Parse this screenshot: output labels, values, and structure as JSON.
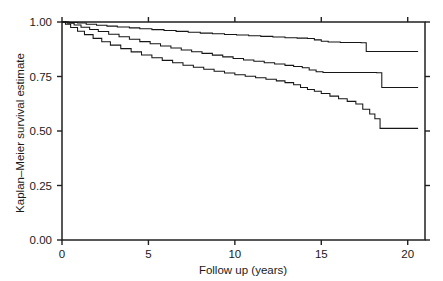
{
  "chart_data": {
    "type": "line",
    "title": "",
    "subtitle": "",
    "xlabel": "Follow up (years)",
    "ylabel": "Kaplan–Meier survival estimate",
    "xlim": [
      0,
      21
    ],
    "ylim": [
      0,
      1
    ],
    "xticks": [
      0,
      5,
      10,
      15,
      20
    ],
    "xticklabels": [
      "0",
      "5",
      "10",
      "15",
      "20"
    ],
    "yticks": [
      0.0,
      0.25,
      0.5,
      0.75,
      1.0
    ],
    "yticklabels": [
      "0.00",
      "0.25",
      "0.50",
      "0.75",
      "1.00"
    ],
    "grid": false,
    "legend": "none",
    "ticks_all_sides": true,
    "step_shape": "post",
    "series": [
      {
        "name": "curve-upper",
        "color": "#161616",
        "x": [
          0.0,
          0.4,
          0.9,
          1.4,
          2.0,
          2.6,
          3.2,
          3.9,
          4.5,
          5.2,
          5.9,
          6.6,
          7.3,
          8.0,
          8.7,
          9.4,
          10.1,
          10.8,
          11.5,
          12.2,
          12.9,
          13.6,
          14.2,
          14.6,
          15.0,
          15.4,
          16.1,
          17.3,
          17.6,
          20.6
        ],
        "y": [
          1.0,
          0.998,
          0.995,
          0.99,
          0.985,
          0.981,
          0.977,
          0.973,
          0.969,
          0.965,
          0.961,
          0.957,
          0.953,
          0.949,
          0.946,
          0.943,
          0.94,
          0.937,
          0.934,
          0.931,
          0.928,
          0.926,
          0.924,
          0.918,
          0.912,
          0.908,
          0.906,
          0.905,
          0.865,
          0.865
        ]
      },
      {
        "name": "curve-middle",
        "color": "#161616",
        "x": [
          0.0,
          0.3,
          0.7,
          1.1,
          1.6,
          2.1,
          2.7,
          3.3,
          3.9,
          4.5,
          5.1,
          5.7,
          6.3,
          6.9,
          7.5,
          8.1,
          8.7,
          9.3,
          9.9,
          10.5,
          11.1,
          11.7,
          12.3,
          12.9,
          13.4,
          13.9,
          14.3,
          14.7,
          15.1,
          18.2,
          18.5,
          20.6
        ],
        "y": [
          1.0,
          0.994,
          0.986,
          0.976,
          0.966,
          0.956,
          0.944,
          0.932,
          0.921,
          0.91,
          0.9,
          0.89,
          0.881,
          0.872,
          0.864,
          0.856,
          0.848,
          0.84,
          0.833,
          0.826,
          0.82,
          0.813,
          0.807,
          0.801,
          0.796,
          0.79,
          0.78,
          0.772,
          0.768,
          0.767,
          0.7,
          0.7
        ]
      },
      {
        "name": "curve-lower",
        "color": "#161616",
        "x": [
          0.0,
          0.2,
          0.5,
          0.9,
          1.3,
          1.8,
          2.3,
          2.8,
          3.4,
          4.0,
          4.6,
          5.2,
          5.8,
          6.4,
          7.0,
          7.6,
          8.2,
          8.8,
          9.4,
          10.0,
          10.6,
          11.2,
          11.8,
          12.4,
          12.9,
          13.4,
          13.8,
          14.2,
          14.6,
          15.0,
          15.5,
          16.0,
          16.5,
          17.0,
          17.4,
          17.8,
          18.1,
          18.4,
          20.6
        ],
        "y": [
          1.0,
          0.99,
          0.975,
          0.958,
          0.942,
          0.925,
          0.909,
          0.894,
          0.878,
          0.863,
          0.849,
          0.836,
          0.824,
          0.813,
          0.802,
          0.792,
          0.783,
          0.774,
          0.766,
          0.758,
          0.751,
          0.744,
          0.737,
          0.73,
          0.722,
          0.712,
          0.7,
          0.69,
          0.682,
          0.672,
          0.66,
          0.648,
          0.636,
          0.624,
          0.6,
          0.578,
          0.556,
          0.512,
          0.512
        ]
      }
    ]
  }
}
